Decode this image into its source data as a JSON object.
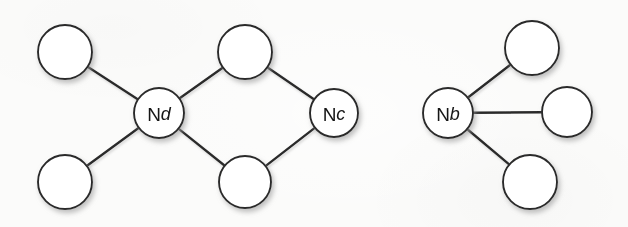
{
  "figure": {
    "background_color": "#fbfbfa",
    "stroke_color": "#2b2b2b",
    "node_fill_color": "#ffffff",
    "label_color": "#141414",
    "shadow_color": "#b9b9b9"
  },
  "chart_data": {
    "type": "diagram",
    "title": "",
    "nodes": [
      {
        "id": "p1",
        "label": "",
        "label_prefix": "",
        "label_suffix": "",
        "cx": 65,
        "cy": 52,
        "r": 27,
        "labeled": false,
        "name": "peripheral-node-top-left"
      },
      {
        "id": "p2",
        "label": "",
        "label_prefix": "",
        "label_suffix": "",
        "cx": 65,
        "cy": 182,
        "r": 27,
        "labeled": false,
        "name": "peripheral-node-bottom-left"
      },
      {
        "id": "p3",
        "label": "",
        "label_prefix": "",
        "label_suffix": "",
        "cx": 245,
        "cy": 52,
        "r": 27,
        "labeled": false,
        "name": "peripheral-node-top-middle"
      },
      {
        "id": "p4",
        "label": "",
        "label_prefix": "",
        "label_suffix": "",
        "cx": 245,
        "cy": 182,
        "r": 26,
        "labeled": false,
        "name": "peripheral-node-bottom-middle"
      },
      {
        "id": "nd",
        "label": "Nd",
        "label_prefix": "N",
        "label_suffix": "d",
        "cx": 159,
        "cy": 113,
        "r": 25,
        "labeled": true,
        "name": "node-nd"
      },
      {
        "id": "nc",
        "label": "Nc",
        "label_prefix": "N",
        "label_suffix": "c",
        "cx": 334,
        "cy": 113,
        "r": 24,
        "labeled": true,
        "name": "node-nc"
      },
      {
        "id": "nb",
        "label": "Nb",
        "label_prefix": "N",
        "label_suffix": "b",
        "cx": 448,
        "cy": 113,
        "r": 25,
        "labeled": true,
        "name": "node-nb"
      },
      {
        "id": "p5",
        "label": "",
        "label_prefix": "",
        "label_suffix": "",
        "cx": 532,
        "cy": 48,
        "r": 27,
        "labeled": false,
        "name": "peripheral-node-top-right"
      },
      {
        "id": "p6",
        "label": "",
        "label_prefix": "",
        "label_suffix": "",
        "cx": 567,
        "cy": 112,
        "r": 25,
        "labeled": false,
        "name": "peripheral-node-middle-right"
      },
      {
        "id": "p7",
        "label": "",
        "label_prefix": "",
        "label_suffix": "",
        "cx": 530,
        "cy": 182,
        "r": 27,
        "labeled": false,
        "name": "peripheral-node-bottom-right"
      }
    ],
    "edges": [
      {
        "from": "p1",
        "to": "nd",
        "name": "edge-top-left-to-nd"
      },
      {
        "from": "p2",
        "to": "nd",
        "name": "edge-bottom-left-to-nd"
      },
      {
        "from": "p3",
        "to": "nd",
        "name": "edge-top-middle-to-nd"
      },
      {
        "from": "p4",
        "to": "nd",
        "name": "edge-bottom-middle-to-nd"
      },
      {
        "from": "nd",
        "to": "nc",
        "name": "edge-nd-to-nc"
      },
      {
        "from": "p3",
        "to": "nc",
        "name": "edge-top-middle-to-nc"
      },
      {
        "from": "p4",
        "to": "nc",
        "name": "edge-bottom-middle-to-nc"
      },
      {
        "from": "nc",
        "to": "nb",
        "name": "edge-nc-to-nb"
      },
      {
        "from": "nb",
        "to": "p5",
        "name": "edge-nb-to-top-right"
      },
      {
        "from": "nb",
        "to": "p6",
        "name": "edge-nb-to-middle-right"
      },
      {
        "from": "nb",
        "to": "p7",
        "name": "edge-nb-to-bottom-right"
      }
    ],
    "node_count": 10,
    "edge_count": 11,
    "labels": [
      "Nd",
      "Nc",
      "Nb"
    ]
  }
}
